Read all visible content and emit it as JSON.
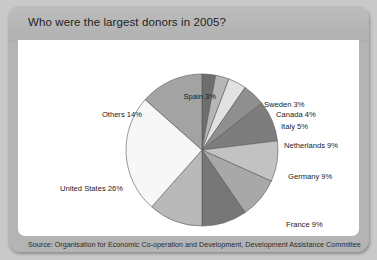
{
  "figure": {
    "title": "Who were the largest donors in 2005?",
    "source": "Source: Organisation for Economic Co-operation and Development, Development Assistance Committee"
  },
  "chart_data": {
    "type": "pie",
    "title": "Who were the largest donors in 2005?",
    "unit": "percent",
    "start_angle_deg": 0,
    "direction": "clockwise",
    "labels": [
      "Spain 3%",
      "Sweden 3%",
      "Canada 4%",
      "Italy 5%",
      "Netherlands 9%",
      "Germany 9%",
      "France 9%",
      "United Kingdom 10%",
      "Japan 12%",
      "United States 26%",
      "Others 14%"
    ],
    "categories": [
      "Spain",
      "Sweden",
      "Canada",
      "Italy",
      "Netherlands",
      "Germany",
      "France",
      "United Kingdom",
      "Japan",
      "United States",
      "Others"
    ],
    "values": [
      3,
      3,
      4,
      5,
      9,
      9,
      9,
      10,
      12,
      26,
      14
    ],
    "colors": [
      "#6e6e6e",
      "#b6b6b6",
      "#e2e2e2",
      "#8f8f8f",
      "#7d7d7d",
      "#c2c2c2",
      "#a8a8a8",
      "#767676",
      "#b9b9b9",
      "#f7f7f7",
      "#a3a3a3"
    ],
    "legend": "none",
    "labels_placement": "outside-leader"
  },
  "labels_layout": [
    {
      "text": "Spain 3%",
      "left": 198,
      "top": 52,
      "anchor": "end"
    },
    {
      "text": "Sweden 3%",
      "left": 246,
      "top": 60,
      "anchor": "start"
    },
    {
      "text": "Canada 4%",
      "left": 258,
      "top": 70,
      "anchor": "start"
    },
    {
      "text": "Italy 5%",
      "left": 263,
      "top": 82,
      "anchor": "start"
    },
    {
      "text": "Netherlands 9%",
      "left": 266,
      "top": 101,
      "anchor": "start"
    },
    {
      "text": "Germany 9%",
      "left": 270,
      "top": 132,
      "anchor": "start"
    },
    {
      "text": "France 9%",
      "left": 268,
      "top": 180,
      "anchor": "start"
    },
    {
      "text": "United Kingdom 10%",
      "left": 232,
      "top": 212,
      "anchor": "start"
    },
    {
      "text": "Japan 12%",
      "left": 147,
      "top": 219,
      "anchor": "start"
    },
    {
      "text": "United States 26%",
      "left": 105,
      "top": 144,
      "anchor": "end"
    },
    {
      "text": "Others 14%",
      "left": 124,
      "top": 70,
      "anchor": "end"
    }
  ]
}
